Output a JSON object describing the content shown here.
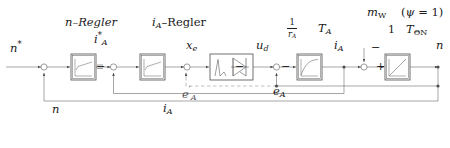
{
  "diagram": {
    "line_color": "#4d4d4d",
    "text_color": "#1a1a1a",
    "block_fill": "#ffffff",
    "dashed_color": "#8c8c8c"
  },
  "block_titles": {
    "speed_controller": "n–Regler",
    "current_controller": "i_A–Regler"
  },
  "blocks": [
    {
      "id": "speed-controller",
      "name": "n-Regler",
      "glyph": "pi-ramp"
    },
    {
      "id": "current-controller",
      "name": "i_A-Regler",
      "glyph": "pi-ramp"
    },
    {
      "id": "converter",
      "name": "Stromrichter",
      "glyph": "thyristor"
    },
    {
      "id": "armature-lag",
      "name": "Ankerkreis PT1",
      "glyph": "exp-curve"
    },
    {
      "id": "mech-integrator",
      "name": "Mechanik Integrator",
      "glyph": "ramp"
    }
  ],
  "signals": {
    "n_ref": "n*",
    "i_a_ref": "i*_A",
    "x_e": "x_e",
    "u_d": "u_d",
    "i_a": "i_A",
    "n_out": "n",
    "m_w": "m_W",
    "psi": "(ψ = 1)",
    "e_a": "e_A",
    "e_a_prime": "e'_A",
    "n_feedback": "n",
    "i_a_feedback": "i_A"
  },
  "parameters": {
    "gain_r_a_num": "1",
    "gain_r_a_den": "r_A",
    "time_const_a": "T_A",
    "gain_theta": "1",
    "time_const_theta": "T_ΘN"
  },
  "summing_junctions": [
    {
      "id": "sum-speed",
      "name": "speed-error-sum",
      "signs": [
        "-"
      ]
    },
    {
      "id": "sum-current",
      "name": "current-error-sum",
      "signs": [
        "-"
      ]
    },
    {
      "id": "sum-xe",
      "name": "xe-sum",
      "signs": [
        "+"
      ]
    },
    {
      "id": "sum-ud",
      "name": "emf-sum",
      "signs": [
        "-"
      ]
    },
    {
      "id": "sum-torque",
      "name": "torque-sum",
      "signs": [
        "-"
      ]
    }
  ]
}
